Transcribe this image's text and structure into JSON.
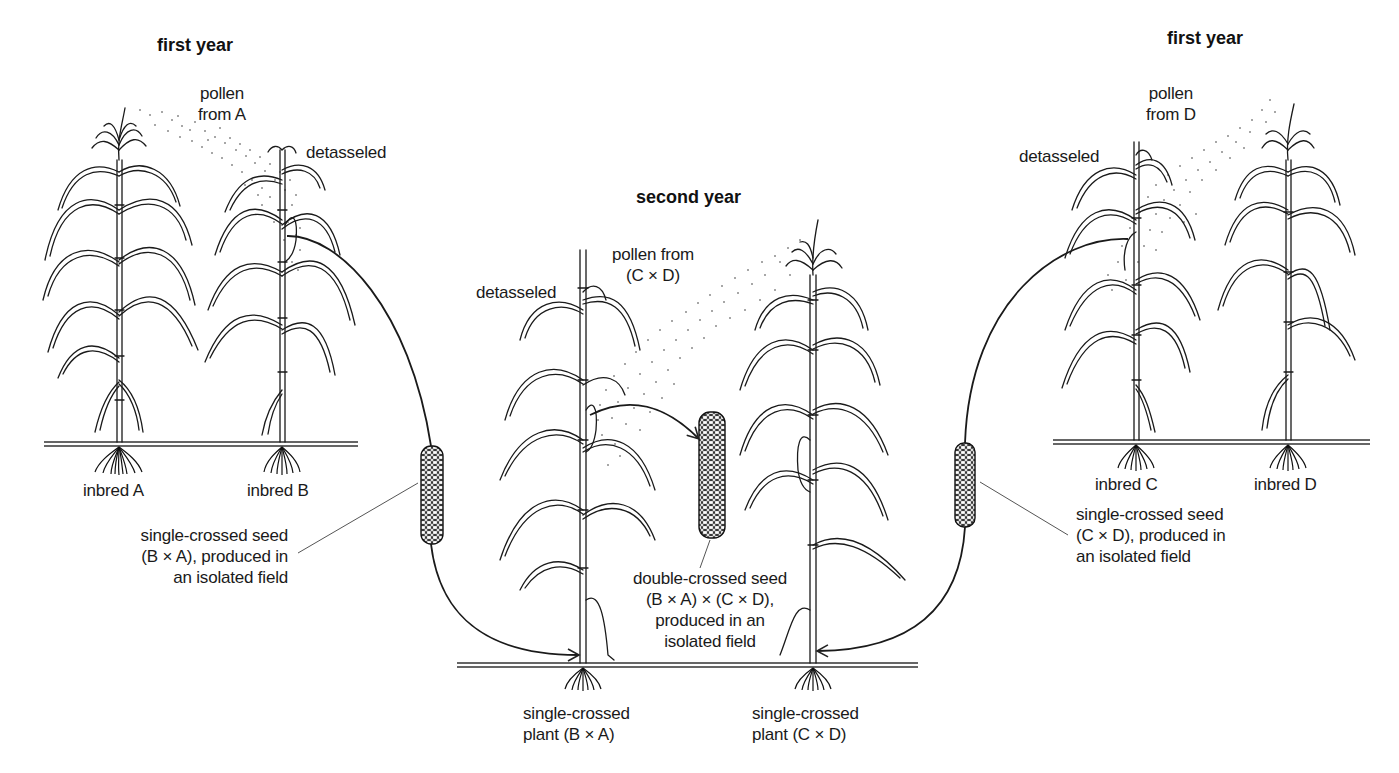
{
  "diagram": {
    "title_left": "first year",
    "title_center": "second year",
    "title_right": "first year",
    "left_field": {
      "pollen_label": [
        "pollen",
        "from A"
      ],
      "detasseled_label": "detasseled",
      "plants": [
        "inbred A",
        "inbred B"
      ],
      "seed_label": [
        "single-crossed seed",
        "(B × A), produced in",
        "an isolated field"
      ]
    },
    "right_field": {
      "pollen_label": [
        "pollen",
        "from D"
      ],
      "detasseled_label": "detasseled",
      "plants": [
        "inbred C",
        "inbred D"
      ],
      "seed_label": [
        "single-crossed seed",
        "(C × D), produced in",
        "an isolated field"
      ]
    },
    "center_field": {
      "pollen_label": [
        "pollen from",
        "(C × D)"
      ],
      "detasseled_label": "detasseled",
      "plants": [
        [
          "single-crossed",
          "plant (B × A)"
        ],
        [
          "single-crossed",
          "plant (C × D)"
        ]
      ],
      "seed_label": [
        "double-crossed seed",
        "(B × A) × (C × D),",
        "produced in an",
        "isolated field"
      ]
    },
    "colors": {
      "ink": "#1a1a1a",
      "background": "#ffffff",
      "pollen": "#9a9a9a"
    }
  }
}
